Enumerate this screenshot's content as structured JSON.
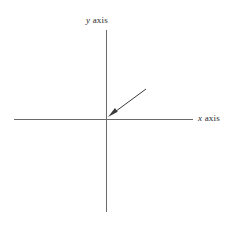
{
  "figure": {
    "title": "",
    "background_color": "#ffffff",
    "width": 232,
    "height": 229
  },
  "chart_data": {
    "type": "scatter",
    "title": "",
    "xlabel": "x axis",
    "ylabel": "y axis",
    "x": [],
    "values": [],
    "categories": [],
    "grid": false,
    "legend": "none",
    "axes": {
      "style": "cartesian-cross",
      "origin": {
        "x": 106,
        "y": 119
      },
      "x_axis": {
        "start_x": 14,
        "end_x": 193,
        "y": 119,
        "color": "#6a6a6a",
        "width": 1
      },
      "y_axis": {
        "start_y": 30,
        "end_y": 212,
        "x": 106,
        "color": "#6a6a6a",
        "width": 1
      },
      "xlim": [],
      "ylim": [],
      "ticks": []
    },
    "annotations": [
      {
        "name": "origin-arrow",
        "text": "",
        "from": {
          "x": 146,
          "y": 89
        },
        "to": {
          "x": 108,
          "y": 117
        },
        "color": "#3a3a3a",
        "arrowhead": "filled-triangle"
      }
    ]
  },
  "labels": {
    "x_axis": {
      "variable": "x",
      "suffix": " axis",
      "full": "x axis"
    },
    "y_axis": {
      "variable": "y",
      "suffix": " axis",
      "full": "y axis"
    }
  },
  "colors": {
    "axis_line": "#6a6a6a",
    "arrow": "#3a3a3a",
    "text": "#2b2b2b",
    "background": "#ffffff"
  }
}
